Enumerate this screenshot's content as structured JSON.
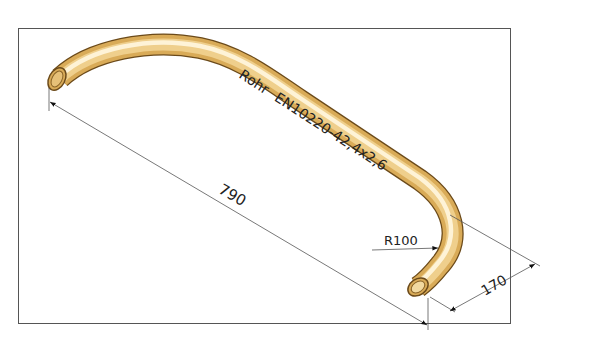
{
  "drawing": {
    "title": "Rohr EN10220-42,4x2,6",
    "part_label": "Rohr",
    "standard": "EN10220-42,4x2,6",
    "dimensions": {
      "length": "790",
      "end_leg": "170",
      "bend_radius": "R100"
    },
    "colors": {
      "pipe_fill": "#e2b868",
      "pipe_edge": "#6b4a1a",
      "pipe_highlight": "#fff6df",
      "dimension_line": "#555555",
      "frame": "#555555"
    }
  }
}
